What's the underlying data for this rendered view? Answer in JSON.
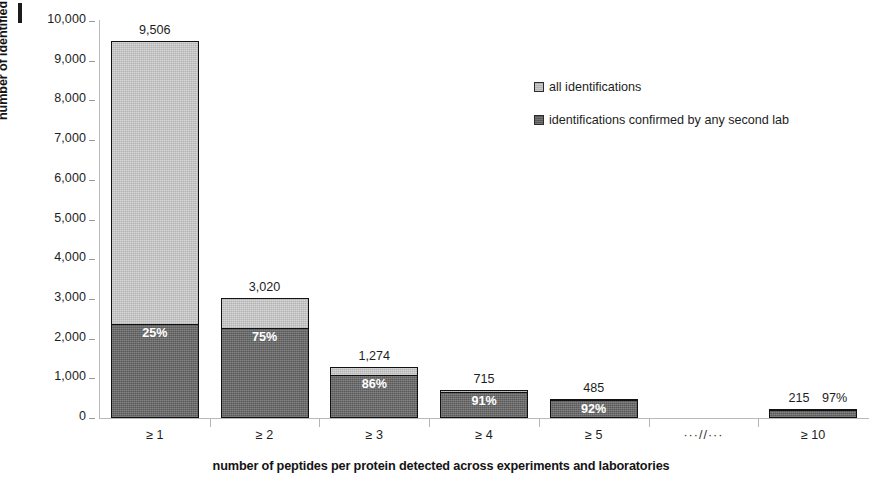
{
  "chart_data": {
    "type": "bar",
    "subtype": "stacked",
    "title": "",
    "xlabel": "number of peptides per protein detected across experiments and laboratories",
    "ylabel": "number of identified proteins",
    "ylim": [
      0,
      10000
    ],
    "ytick_labels": [
      "10,000",
      "9,000",
      "8,000",
      "7,000",
      "6,000",
      "5,000",
      "4,000",
      "3,000",
      "2,000",
      "1,000",
      "0"
    ],
    "ytick_values": [
      10000,
      9000,
      8000,
      7000,
      6000,
      5000,
      4000,
      3000,
      2000,
      1000,
      0
    ],
    "grid": false,
    "legend_position": "upper-right-inside",
    "categories": [
      "≥ 1",
      "≥ 2",
      "≥ 3",
      "≥ 4",
      "≥ 5",
      "···//···",
      "≥ 10"
    ],
    "series": [
      {
        "name": "all identifications",
        "color": "#b3b3b3",
        "values": [
          9506,
          3020,
          1274,
          715,
          485,
          null,
          215
        ]
      },
      {
        "name": "identifications confirmed by any second lab",
        "color": "#595959",
        "values": [
          2377,
          2265,
          1096,
          651,
          446,
          null,
          209
        ]
      }
    ],
    "total_labels": [
      "9,506",
      "3,020",
      "1,274",
      "715",
      "485",
      "",
      "215"
    ],
    "percent_labels": [
      "25%",
      "75%",
      "86%",
      "91%",
      "92%",
      "",
      "97%"
    ],
    "percent_values": [
      25,
      75,
      86,
      91,
      92,
      null,
      97
    ]
  },
  "bars": [
    {
      "category": "≥ 1",
      "total": 9506,
      "total_label": "9,506",
      "pct_label": "25%",
      "pct": 25,
      "dark": 2377,
      "pct_inside": true
    },
    {
      "category": "≥ 2",
      "total": 3020,
      "total_label": "3,020",
      "pct_label": "75%",
      "pct": 75,
      "dark": 2265,
      "pct_inside": true
    },
    {
      "category": "≥ 3",
      "total": 1274,
      "total_label": "1,274",
      "pct_label": "86%",
      "pct": 86,
      "dark": 1096,
      "pct_inside": true
    },
    {
      "category": "≥ 4",
      "total": 715,
      "total_label": "715",
      "pct_label": "91%",
      "pct": 91,
      "dark": 651,
      "pct_inside": true
    },
    {
      "category": "≥ 5",
      "total": 485,
      "total_label": "485",
      "pct_label": "92%",
      "pct": 92,
      "dark": 446,
      "pct_inside": true
    },
    {
      "category": "≥ 10",
      "total": 215,
      "total_label": "215",
      "pct_label": "97%",
      "pct": 97,
      "dark": 209,
      "pct_inside": false
    }
  ],
  "axis": {
    "break_marker": "···//···",
    "y_title": "number of identified proteins",
    "x_title": "number of peptides per protein detected across experiments and laboratories"
  },
  "legend": {
    "items": [
      {
        "label": "all identifications",
        "swatch": "light"
      },
      {
        "label": "identifications confirmed by any second lab",
        "swatch": "dark"
      }
    ]
  },
  "panel": {
    "mark": ""
  }
}
